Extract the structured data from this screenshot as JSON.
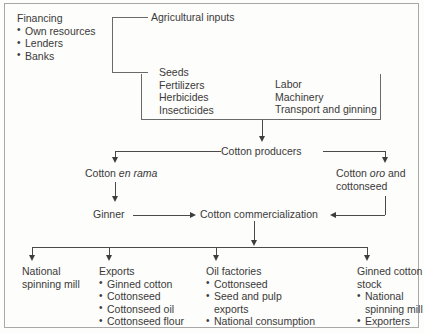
{
  "diagram": {
    "financing": {
      "heading": "Financing",
      "items": [
        "Own resources",
        "Lenders",
        "Banks"
      ]
    },
    "agricultural_inputs": {
      "heading": "Agricultural inputs"
    },
    "inputs_box": {
      "left_items": [
        "Seeds",
        "Fertilizers",
        "Herbicides",
        "Insecticides"
      ],
      "right_items": [
        "Labor",
        "Machinery",
        "Transport and ginning"
      ]
    },
    "producers": {
      "label": "Cotton producers"
    },
    "en_rama": {
      "prefix": "Cotton ",
      "italic": "en rama"
    },
    "oro": {
      "prefix": "Cotton ",
      "italic": "oro",
      "suffix": " and",
      "line2": "cottonseed"
    },
    "ginner": {
      "label": "Ginner"
    },
    "commercialization": {
      "label": "Cotton commercialization"
    },
    "outputs": [
      {
        "heading": "National",
        "heading2": "spinning mill",
        "items": []
      },
      {
        "heading": "Exports",
        "heading2": "",
        "items": [
          "Ginned cotton",
          "Cottonseed",
          "Cottonseed oil",
          "Cottonseed flour"
        ]
      },
      {
        "heading": "Oil factories",
        "heading2": "",
        "items": [
          "Cottonseed",
          "Seed and pulp",
          "exports",
          "National consumption"
        ]
      },
      {
        "heading": "Ginned cotton",
        "heading2": "stock",
        "items": [
          "National",
          "spinning mill",
          "Exporters"
        ]
      }
    ]
  },
  "colors": {
    "line": "#4a4a4a",
    "text": "#3a3a3a",
    "frame": "#a8a8a8",
    "background": "#fdfdfb"
  }
}
